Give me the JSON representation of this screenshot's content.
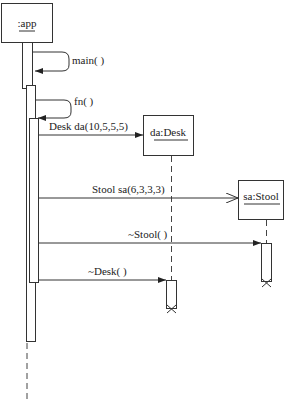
{
  "diagram": {
    "type": "sequence",
    "objects": [
      {
        "id": "app",
        "label": ":app"
      },
      {
        "id": "desk",
        "label": "da:Desk"
      },
      {
        "id": "stool",
        "label": "sa:Stool"
      }
    ],
    "messages": [
      {
        "label": "main( )",
        "from": "app",
        "to": "app",
        "kind": "self-call"
      },
      {
        "label": "fn( )",
        "from": "app",
        "to": "app",
        "kind": "self-call"
      },
      {
        "label": "Desk da(10,5,5,5)",
        "from": "app",
        "to": "desk",
        "kind": "create"
      },
      {
        "label": "Stool sa(6,3,3,3)",
        "from": "app",
        "to": "stool",
        "kind": "create"
      },
      {
        "label": "~Stool( )",
        "from": "app",
        "to": "stool",
        "kind": "destroy"
      },
      {
        "label": "~Desk( )",
        "from": "app",
        "to": "desk",
        "kind": "destroy"
      }
    ]
  }
}
